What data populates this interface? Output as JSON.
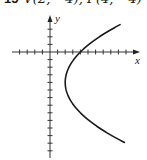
{
  "problem": {
    "number": "15",
    "given": "V(2, −4), F(4, −4)"
  },
  "graph": {
    "x_label": "x",
    "y_label": "y",
    "curve": "parabola opening right",
    "vertex": [
      2,
      -4
    ],
    "focus": [
      4,
      -4
    ],
    "equation": "(y + 4)² = 8(x − 2)",
    "tick_spacing_units": 1,
    "x_range": [
      -5,
      11
    ],
    "y_range": [
      -14,
      4
    ],
    "stroke_color": "#1a1a1a"
  }
}
